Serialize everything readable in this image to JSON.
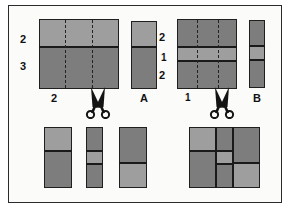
{
  "figure": {
    "background_color": "#fbfbfa",
    "border_color": "#2b2b2b",
    "fill_light": "#9e9e9e",
    "fill_dark": "#7d7d7d"
  },
  "left_panel": {
    "source_rect": {
      "name": "left-source-rectangle",
      "row_labels": [
        "2",
        "3"
      ],
      "bottom_label": "2",
      "row_ratios": [
        2,
        3
      ],
      "column_count": 3,
      "dashed_column_lines": 2
    },
    "result_strip": {
      "name": "strip-A",
      "label": "A",
      "bands": [
        {
          "tone": "light",
          "ratio": 2
        },
        {
          "tone": "dark",
          "ratio": 3
        }
      ]
    },
    "scissors_icon": "scissors-icon"
  },
  "right_panel": {
    "source_rect": {
      "name": "right-source-rectangle",
      "row_labels": [
        "2",
        "1",
        "2"
      ],
      "bottom_label": "1",
      "row_ratios": [
        2,
        1,
        2
      ],
      "column_count": 3,
      "dashed_column_lines": 2
    },
    "result_strip": {
      "name": "strip-B",
      "label": "B",
      "bands": [
        {
          "tone": "dark",
          "ratio": 2
        },
        {
          "tone": "light",
          "ratio": 1
        },
        {
          "tone": "dark",
          "ratio": 2
        }
      ]
    },
    "scissors_icon": "scissors-icon"
  },
  "bottom_left_result": {
    "name": "bottom-left-strips",
    "strips": [
      {
        "name": "strip-1",
        "bands": [
          {
            "tone": "light",
            "ratio": 2
          },
          {
            "tone": "dark",
            "ratio": 3
          }
        ]
      },
      {
        "name": "strip-2",
        "bands": [
          {
            "tone": "dark",
            "ratio": 2
          },
          {
            "tone": "light",
            "ratio": 1
          },
          {
            "tone": "dark",
            "ratio": 2
          }
        ]
      },
      {
        "name": "strip-3",
        "bands": [
          {
            "tone": "dark",
            "ratio": 3
          },
          {
            "tone": "light",
            "ratio": 2
          }
        ]
      }
    ]
  },
  "bottom_right_result": {
    "name": "pinwheel-square",
    "description": "square assembled from cut strips",
    "columns": [
      {
        "name": "left-column",
        "bands": [
          {
            "tone": "light",
            "ratio": 2
          },
          {
            "tone": "dark",
            "ratio": 3
          }
        ]
      },
      {
        "name": "middle-column",
        "bands": [
          {
            "tone": "dark",
            "ratio": 2
          },
          {
            "tone": "light",
            "ratio": 1
          },
          {
            "tone": "dark",
            "ratio": 2
          }
        ]
      },
      {
        "name": "right-column",
        "bands": [
          {
            "tone": "dark",
            "ratio": 3
          },
          {
            "tone": "light",
            "ratio": 2
          }
        ]
      }
    ]
  }
}
